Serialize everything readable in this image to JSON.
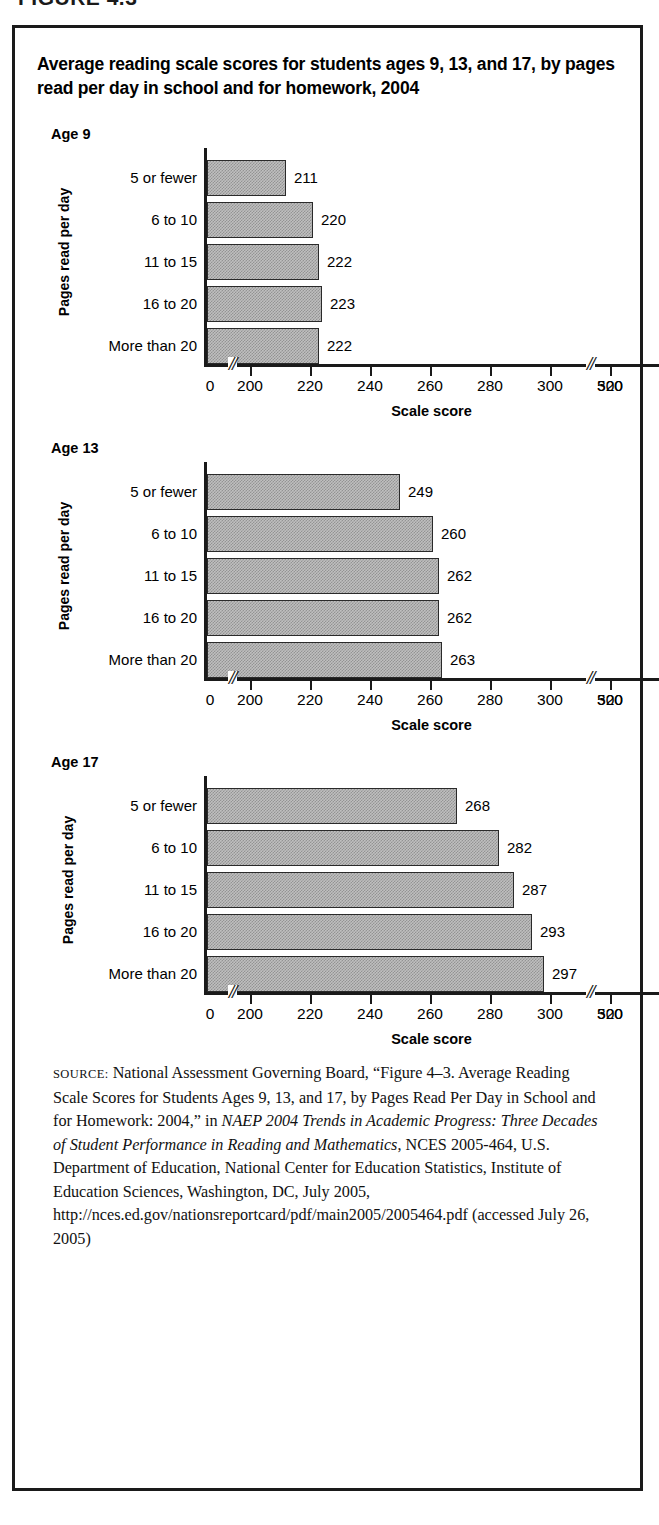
{
  "figure_tag": "FIGURE 4.3",
  "title": "Average reading scale scores for students ages 9, 13, and 17, by pages read per day in school and for homework, 2004",
  "axis": {
    "ylabel": "Pages read per day",
    "xlabel": "Scale score",
    "xticks": [
      "0",
      "200",
      "220",
      "240",
      "260",
      "280",
      "300",
      "320",
      "500"
    ]
  },
  "charts": [
    {
      "age_label": "Age 9"
    },
    {
      "age_label": "Age 13"
    },
    {
      "age_label": "Age 17"
    }
  ],
  "source": {
    "label": "SOURCE:",
    "line1": " National Assessment Governing Board, “Figure 4–3. Average Reading Scale Scores for Students Ages 9, 13, and 17, by Pages Read Per Day in School and for Homework: 2004,” in ",
    "italic1": "NAEP 2004 Trends in Academic Progress: Three Decades of Student Performance in Reading and Mathematics",
    "line2": ", NCES 2005-464, U.S. Department of Education, National Center for Education Statistics, Institute of Education Sciences, Washington, DC, July 2005, http://nces.ed.gov/nationsreportcard/pdf/main2005/2005464.pdf (accessed July 26, 2005)"
  },
  "chart_data": [
    {
      "type": "bar",
      "orientation": "horizontal",
      "title": "Age 9",
      "categories": [
        "5 or fewer",
        "6 to 10",
        "11 to 15",
        "16 to 20",
        "More than 20"
      ],
      "values": [
        211,
        220,
        222,
        223,
        222
      ],
      "xlabel": "Scale score",
      "ylabel": "Pages read per day",
      "xlim": [
        200,
        320
      ],
      "xticks": [
        0,
        200,
        220,
        240,
        260,
        280,
        300,
        320,
        500
      ],
      "axis_break": true,
      "grid": false,
      "legend": "none"
    },
    {
      "type": "bar",
      "orientation": "horizontal",
      "title": "Age 13",
      "categories": [
        "5 or fewer",
        "6 to 10",
        "11 to 15",
        "16 to 20",
        "More than 20"
      ],
      "values": [
        249,
        260,
        262,
        262,
        263
      ],
      "xlabel": "Scale score",
      "ylabel": "Pages read per day",
      "xlim": [
        200,
        320
      ],
      "xticks": [
        0,
        200,
        220,
        240,
        260,
        280,
        300,
        320,
        500
      ],
      "axis_break": true,
      "grid": false,
      "legend": "none"
    },
    {
      "type": "bar",
      "orientation": "horizontal",
      "title": "Age 17",
      "categories": [
        "5 or fewer",
        "6 to 10",
        "11 to 15",
        "16 to 20",
        "More than 20"
      ],
      "values": [
        268,
        282,
        287,
        293,
        297
      ],
      "xlabel": "Scale score",
      "ylabel": "Pages read per day",
      "xlim": [
        200,
        320
      ],
      "xticks": [
        0,
        200,
        220,
        240,
        260,
        280,
        300,
        320,
        500
      ],
      "axis_break": true,
      "grid": false,
      "legend": "none"
    }
  ]
}
